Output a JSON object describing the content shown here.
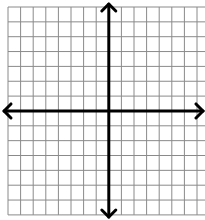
{
  "diagram": {
    "type": "coordinate-plane",
    "grid": {
      "columns": 16,
      "rows": 14,
      "columns_left_of_y_axis": 8,
      "columns_right_of_y_axis": 8,
      "rows_above_x_axis": 7,
      "rows_below_x_axis": 7,
      "line_color": "#8a8a8a",
      "background": "#ffffff"
    },
    "axes": {
      "x_axis": {
        "arrows": [
          "left",
          "right"
        ],
        "color": "#000000",
        "label": ""
      },
      "y_axis": {
        "arrows": [
          "up",
          "down"
        ],
        "color": "#000000",
        "label": ""
      }
    },
    "tick_labels": [],
    "points": []
  }
}
